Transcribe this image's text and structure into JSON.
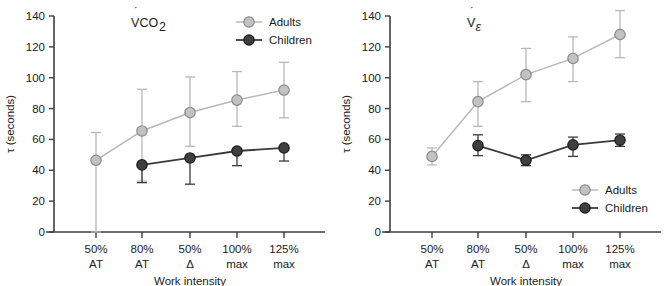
{
  "figure": {
    "panel_count": 2
  },
  "chart_data": [
    {
      "id": "vco2",
      "type": "line",
      "title": "V̇CO2",
      "title_parts": {
        "v": "V",
        "dot": "˙",
        "co": "CO",
        "sub": "2"
      },
      "xlabel": "Work intensity",
      "ylabel": "τ (seconds)",
      "categories": [
        "50% AT",
        "80% AT",
        "50% Δ",
        "100% max",
        "125% max"
      ],
      "category_lines": [
        {
          "top": "50%",
          "bottom": "AT"
        },
        {
          "top": "80%",
          "bottom": "AT"
        },
        {
          "top": "50%",
          "bottom": "Δ"
        },
        {
          "top": "100%",
          "bottom": "max"
        },
        {
          "top": "125%",
          "bottom": "max"
        }
      ],
      "ylim": [
        0,
        140
      ],
      "yticks": [
        0,
        20,
        40,
        60,
        80,
        100,
        120,
        140
      ],
      "grid": false,
      "legend_position": "top-right",
      "series": [
        {
          "name": "Adults",
          "color": "#b8b8b8",
          "marker_fill": "#c2c2c2",
          "marker_edge": "#8a8a8a",
          "x_index": [
            0,
            1,
            2,
            3,
            4
          ],
          "values": [
            46.5,
            65.5,
            77.5,
            85.5,
            92.0
          ],
          "err_low": [
            46.5,
            32.5,
            22.0,
            17.0,
            18.0
          ],
          "err_high": [
            18.0,
            27.0,
            23.0,
            18.5,
            18.0
          ],
          "lower": [
            0,
            33.0,
            55.5,
            68.5,
            74.0
          ],
          "upper": [
            64.5,
            92.5,
            100.5,
            104.0,
            110.0
          ]
        },
        {
          "name": "Children",
          "color": "#3a3a3a",
          "marker_fill": "#3f3f3f",
          "marker_edge": "#1b1b1b",
          "x_index": [
            1,
            2,
            3,
            4
          ],
          "values": [
            43.5,
            48.0,
            52.5,
            54.5
          ],
          "err_low": [
            11.5,
            17.0,
            9.5,
            8.5
          ],
          "err_high": [
            0,
            0,
            0,
            0
          ],
          "lower": [
            32.0,
            31.0,
            43.0,
            46.0
          ],
          "upper": [
            43.5,
            48.0,
            52.5,
            54.5
          ]
        }
      ]
    },
    {
      "id": "ve",
      "type": "line",
      "title": "V̇E",
      "title_parts": {
        "v": "V",
        "dot": "˙",
        "co": "",
        "sub": "ε"
      },
      "xlabel": "Work intensity",
      "ylabel": "τ (seconds)",
      "categories": [
        "50% AT",
        "80% AT",
        "50% Δ",
        "100% max",
        "125% max"
      ],
      "category_lines": [
        {
          "top": "50%",
          "bottom": "AT"
        },
        {
          "top": "80%",
          "bottom": "AT"
        },
        {
          "top": "50%",
          "bottom": "Δ"
        },
        {
          "top": "100%",
          "bottom": "max"
        },
        {
          "top": "125%",
          "bottom": "max"
        }
      ],
      "ylim": [
        0,
        140
      ],
      "yticks": [
        0,
        20,
        40,
        60,
        80,
        100,
        120,
        140
      ],
      "grid": false,
      "legend_position": "bottom-right",
      "series": [
        {
          "name": "Adults",
          "color": "#b8b8b8",
          "marker_fill": "#c2c2c2",
          "marker_edge": "#8a8a8a",
          "x_index": [
            0,
            1,
            2,
            3,
            4
          ],
          "values": [
            49.0,
            84.5,
            102.0,
            112.5,
            128.0
          ],
          "err_low": [
            5.5,
            16.0,
            17.5,
            15.0,
            15.0
          ],
          "err_high": [
            5.5,
            13.0,
            17.0,
            14.0,
            15.5
          ],
          "lower": [
            43.5,
            68.5,
            84.5,
            97.5,
            113.0
          ],
          "upper": [
            54.5,
            97.5,
            119.0,
            126.5,
            143.5
          ]
        },
        {
          "name": "Children",
          "color": "#3a3a3a",
          "marker_fill": "#3f3f3f",
          "marker_edge": "#1b1b1b",
          "x_index": [
            1,
            2,
            3,
            4
          ],
          "values": [
            56.0,
            46.5,
            56.5,
            59.5
          ],
          "err_low": [
            6.5,
            3.5,
            7.5,
            4.0
          ],
          "err_high": [
            7.0,
            3.5,
            5.0,
            4.0
          ],
          "lower": [
            49.5,
            43.0,
            49.0,
            55.5
          ],
          "upper": [
            63.0,
            50.0,
            61.5,
            63.5
          ]
        }
      ]
    }
  ]
}
